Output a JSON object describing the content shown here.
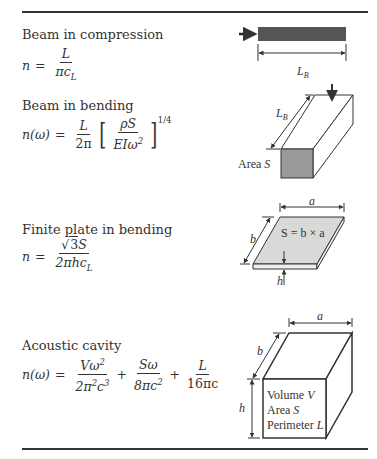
{
  "rows": [
    {
      "title": "Beam in compression",
      "equation": {
        "lhs": "n",
        "eq": "=",
        "num": "L",
        "den_pi": "π",
        "den_c": "c",
        "den_sub": "L"
      },
      "figure": {
        "label_length": "L",
        "label_length_sub": "B"
      }
    },
    {
      "title": "Beam in bending",
      "equation": {
        "lhs": "n(ω)",
        "eq": "=",
        "num": "L",
        "den": "2π",
        "inner_num": "ρS",
        "inner_den": "EIω",
        "inner_den_sup": "2",
        "exponent": "1/4",
        "lbracket": "[",
        "rbracket": "]"
      },
      "figure": {
        "label_length": "L",
        "label_length_sub": "B",
        "label_area": "Area ",
        "label_area_var": "S"
      }
    },
    {
      "title": "Finite plate in bending",
      "equation": {
        "lhs": "n",
        "eq": "=",
        "num_root": "√",
        "num_root_arg": "3",
        "num_var": "S",
        "den": "2πhc",
        "den_sub": "L"
      },
      "figure": {
        "label_a": "a",
        "label_b": "b",
        "label_h": "h",
        "label_area": "S = b × a"
      }
    },
    {
      "title": "Acoustic cavity",
      "equation": {
        "lhs": "n(ω)",
        "eq": "=",
        "t1_num": "Vω",
        "t1_num_sup": "2",
        "t1_den": "2π",
        "t1_den_sup1": "2",
        "t1_den_c": "c",
        "t1_den_sup2": "3",
        "plus1": "+",
        "t2_num": "Sω",
        "t2_den": "8πc",
        "t2_den_sup": "2",
        "plus2": "+",
        "t3_num": "L",
        "t3_den": "16πc"
      },
      "figure": {
        "label_a": "a",
        "label_b": "b",
        "label_h": "h",
        "line1": "Volume ",
        "line1_var": "V",
        "line2": "Area ",
        "line2_var": "S",
        "line3": "Perimeter ",
        "line3_var": "L"
      }
    }
  ],
  "colors": {
    "ink": "#333333",
    "bar_fill": "#555555",
    "face_fill": "#9a9a9a",
    "plate_fill": "#d9d9d9"
  }
}
